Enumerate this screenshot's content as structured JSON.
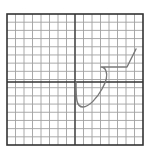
{
  "figure": {
    "label_cropped": "",
    "grid": {
      "left": 7,
      "top": 14,
      "right": 143,
      "bottom": 145,
      "cols": 16,
      "rows": 16,
      "grid_color": "#a0a0a0",
      "border_color": "#333333",
      "axis_color": "#333333",
      "axis_x": 75,
      "axis_y": 82
    },
    "curve": {
      "color": "#7a7a7a",
      "path": "M76,82 C76,88 76,96 77,101 C78,106 80,107 83,107 C89,107 97,98 102,89 C106,82 108,76 106,71 C105,68 103,67 101,67 L127,67 L136,49"
    }
  },
  "chart_data": {
    "type": "line",
    "title": "",
    "xlabel": "",
    "ylabel": "",
    "grid": true,
    "x": [
      0.1,
      0.2,
      1.0,
      3.3,
      3.8,
      3.1,
      6.2,
      7.3
    ],
    "y": [
      0,
      -2.3,
      -3.0,
      -0.8,
      1.3,
      1.8,
      1.8,
      4.0
    ],
    "xlim": [
      -8,
      8
    ],
    "ylim": [
      -8,
      8
    ]
  }
}
